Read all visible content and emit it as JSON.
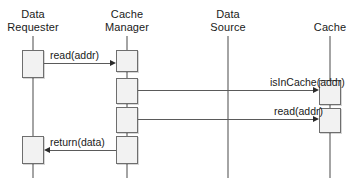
{
  "diagram": {
    "type": "uml-sequence-diagram",
    "title": "",
    "canvas": {
      "width": 352,
      "height": 194,
      "background": "#ffffff"
    },
    "colors": {
      "lifeline": "#4a4a4a",
      "activation_fill": "#f2f2f2",
      "activation_stroke": "#6e6e6e",
      "arrow": "#5a5a5a",
      "arrow_head": "#2b2b2b",
      "text": "#1a1a1a"
    },
    "participants": [
      {
        "id": "data-requester",
        "name": "Data Requester",
        "name_lines": [
          "Data",
          "Requester"
        ],
        "x": 33,
        "label_top": 8,
        "lifeline": {
          "top": 36,
          "bottom": 178
        },
        "activations": [
          {
            "top": 50,
            "height": 28,
            "width": 22
          },
          {
            "top": 136,
            "height": 28,
            "width": 22
          }
        ]
      },
      {
        "id": "cache-manager",
        "name": "Cache Manager",
        "name_lines": [
          "Cache",
          "Manager"
        ],
        "x": 127,
        "label_top": 8,
        "lifeline": {
          "top": 36,
          "bottom": 178
        },
        "activations": [
          {
            "top": 50,
            "height": 22,
            "width": 22
          },
          {
            "top": 78,
            "height": 26,
            "width": 22
          },
          {
            "top": 107,
            "height": 26,
            "width": 22
          },
          {
            "top": 136,
            "height": 28,
            "width": 22
          }
        ]
      },
      {
        "id": "data-source",
        "name": "Data Source",
        "name_lines": [
          "Data",
          "Source"
        ],
        "x": 228,
        "label_top": 8,
        "lifeline": {
          "top": 36,
          "bottom": 178
        },
        "activations": []
      },
      {
        "id": "cache",
        "name": "Cache",
        "name_lines": [
          "Cache"
        ],
        "x": 330,
        "label_top": 21,
        "lifeline": {
          "top": 36,
          "bottom": 178
        },
        "activations": [
          {
            "top": 80,
            "height": 25,
            "width": 22
          },
          {
            "top": 108,
            "height": 25,
            "width": 22
          }
        ]
      }
    ],
    "messages": [
      {
        "id": "read-addr-1",
        "label": "read(addr)",
        "from": "data-requester",
        "to": "cache-manager",
        "direction": "right",
        "y": 63,
        "x_start": 44,
        "x_end": 116,
        "label_x": 50,
        "label_y": 49
      },
      {
        "id": "is-in-cache",
        "label": "isInCache(addr)",
        "from": "cache-manager",
        "to": "cache",
        "direction": "right",
        "y": 90,
        "x_start": 138,
        "x_end": 319,
        "label_x": 270,
        "label_y": 76
      },
      {
        "id": "read-addr-2",
        "label": "read(addr)",
        "from": "cache-manager",
        "to": "cache",
        "direction": "right",
        "y": 119,
        "x_start": 138,
        "x_end": 319,
        "label_x": 274,
        "label_y": 105
      },
      {
        "id": "return-data",
        "label": "return(data)",
        "from": "cache-manager",
        "to": "data-requester",
        "direction": "left",
        "y": 150,
        "x_start": 44,
        "x_end": 116,
        "label_x": 50,
        "label_y": 136
      }
    ]
  }
}
